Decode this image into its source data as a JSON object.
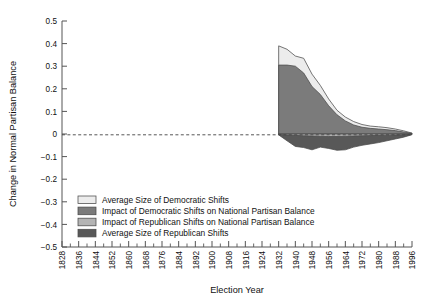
{
  "chart_data": {
    "type": "area",
    "title": "",
    "xlabel": "Election Year",
    "ylabel": "Change in Normal Partisan Balance",
    "xlim": [
      1828,
      1996
    ],
    "ylim": [
      -0.5,
      0.5
    ],
    "grid": false,
    "zero_line": true,
    "zero_line_style": "dashed",
    "legend_position": "lower-left-inside",
    "x_tick_labels": [
      "1828",
      "1836",
      "1844",
      "1852",
      "1860",
      "1868",
      "1876",
      "1884",
      "1892",
      "1900",
      "1908",
      "1916",
      "1924",
      "1932",
      "1940",
      "1948",
      "1956",
      "1964",
      "1972",
      "1980",
      "1988",
      "1996"
    ],
    "x_tick_step": 8,
    "x_minor_tick_step": 4,
    "y_tick_labels": [
      "0.5",
      "0.4",
      "0.3",
      "0.2",
      "0.1",
      "0",
      "-0.1",
      "-0.2",
      "-0.3",
      "-0.4",
      "-0.5"
    ],
    "y_tick_values": [
      0.5,
      0.4,
      0.3,
      0.2,
      0.1,
      0,
      -0.1,
      -0.2,
      -0.3,
      -0.4,
      -0.5
    ],
    "x": [
      1932,
      1936,
      1940,
      1944,
      1948,
      1952,
      1956,
      1960,
      1964,
      1968,
      1972,
      1976,
      1980,
      1984,
      1988,
      1992,
      1996
    ],
    "series": [
      {
        "name": "Average Size of Democratic Shifts",
        "color": "#ececec",
        "values": [
          0.39,
          0.375,
          0.345,
          0.335,
          0.265,
          0.215,
          0.155,
          0.105,
          0.075,
          0.055,
          0.042,
          0.035,
          0.032,
          0.028,
          0.022,
          0.014,
          0.004
        ]
      },
      {
        "name": "Impact of Democratic Shifts on National Partisan Balance",
        "color": "#7b7b7b",
        "values": [
          0.305,
          0.305,
          0.3,
          0.27,
          0.21,
          0.175,
          0.125,
          0.085,
          0.058,
          0.04,
          0.03,
          0.025,
          0.022,
          0.019,
          0.015,
          0.009,
          0.003
        ]
      },
      {
        "name": "Impact of Republican Shifts on National Partisan Balance",
        "color": "#b4b4b4",
        "values": [
          -0.002,
          -0.004,
          -0.006,
          -0.008,
          -0.009,
          -0.01,
          -0.011,
          -0.011,
          -0.01,
          -0.009,
          -0.008,
          -0.007,
          -0.006,
          -0.005,
          -0.004,
          -0.003,
          -0.001
        ]
      },
      {
        "name": "Average Size of Republican Shifts",
        "color": "#585858",
        "values": [
          -0.004,
          -0.03,
          -0.055,
          -0.06,
          -0.07,
          -0.058,
          -0.064,
          -0.072,
          -0.07,
          -0.058,
          -0.05,
          -0.044,
          -0.038,
          -0.03,
          -0.022,
          -0.014,
          -0.003
        ]
      }
    ],
    "legend_entries": [
      {
        "label": "Average Size of Democratic Shifts",
        "color": "#ececec"
      },
      {
        "label": "Impact of Democratic Shifts on National Partisan Balance",
        "color": "#7b7b7b"
      },
      {
        "label": "Impact of Republican Shifts on National Partisan Balance",
        "color": "#b4b4b4"
      },
      {
        "label": "Average Size of Republican Shifts",
        "color": "#585858"
      }
    ]
  }
}
